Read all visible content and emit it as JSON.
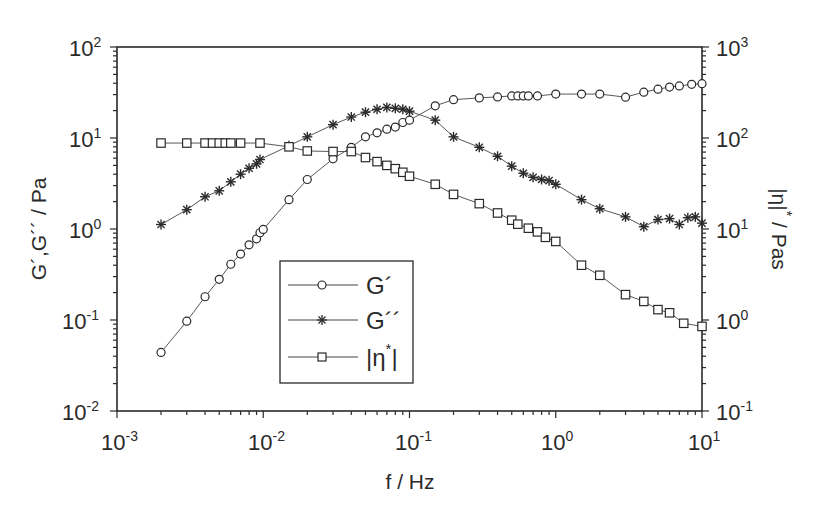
{
  "chart_data": {
    "type": "scatter",
    "title": "",
    "xlabel": "f / Hz",
    "ylabel": "G´,G´´ / Pa",
    "y2label": "|η*| / Pas",
    "xscale": "log",
    "yscale": "log",
    "xlim": [
      0.001,
      10
    ],
    "ylim": [
      0.01,
      100
    ],
    "y2lim": [
      0.1,
      1000
    ],
    "x_ticks": [
      "10^-3",
      "10^-2",
      "10^-1",
      "10^0",
      "10^1"
    ],
    "y_ticks": [
      "10^-2",
      "10^-1",
      "10^0",
      "10^1",
      "10^2"
    ],
    "y2_ticks": [
      "10^-1",
      "10^0",
      "10^1",
      "10^2",
      "10^3"
    ],
    "grid": false,
    "legend_position": "lower-left-center (inside plot)",
    "series": [
      {
        "name": "G´",
        "marker": "circle",
        "axis": "left",
        "x": [
          0.002,
          0.003,
          0.004,
          0.005,
          0.006,
          0.007,
          0.008,
          0.009,
          0.0095,
          0.01,
          0.015,
          0.02,
          0.03,
          0.04,
          0.05,
          0.06,
          0.07,
          0.08,
          0.09,
          0.1,
          0.15,
          0.2,
          0.3,
          0.4,
          0.5,
          0.55,
          0.6,
          0.65,
          0.75,
          1.0,
          1.5,
          2.0,
          3.0,
          4.0,
          5.0,
          6.0,
          7.0,
          8.5,
          10.0
        ],
        "values": [
          0.044,
          0.097,
          0.18,
          0.28,
          0.41,
          0.53,
          0.67,
          0.78,
          0.91,
          0.99,
          2.1,
          3.5,
          5.9,
          7.9,
          10.3,
          11.4,
          12.5,
          13.2,
          14.8,
          15.7,
          22.6,
          26.4,
          27.6,
          28.3,
          29.0,
          29.0,
          29.0,
          29.0,
          29.0,
          30.4,
          30.4,
          30.4,
          28.1,
          31.9,
          34.4,
          36.3,
          37.3,
          38.9,
          39.5
        ]
      },
      {
        "name": "G´´",
        "marker": "asterisk",
        "axis": "left",
        "x": [
          0.002,
          0.003,
          0.004,
          0.005,
          0.006,
          0.007,
          0.008,
          0.009,
          0.0095,
          0.015,
          0.02,
          0.03,
          0.04,
          0.05,
          0.06,
          0.07,
          0.08,
          0.09,
          0.1,
          0.15,
          0.2,
          0.3,
          0.4,
          0.5,
          0.6,
          0.7,
          0.8,
          0.9,
          1.0,
          1.5,
          2.0,
          3.0,
          4.0,
          5.0,
          6.0,
          7.0,
          8.0,
          9.0,
          10.0
        ],
        "values": [
          1.12,
          1.63,
          2.26,
          2.63,
          3.3,
          4.0,
          4.65,
          5.2,
          5.8,
          8.2,
          10.3,
          14.0,
          17.0,
          19.2,
          20.7,
          21.7,
          21.2,
          20.7,
          19.7,
          15.7,
          10.3,
          7.9,
          6.3,
          4.9,
          4.1,
          3.7,
          3.5,
          3.4,
          3.1,
          2.1,
          1.67,
          1.36,
          1.06,
          1.27,
          1.3,
          1.12,
          1.33,
          1.36,
          1.16
        ]
      },
      {
        "name": "|η*|",
        "marker": "square",
        "axis": "right",
        "x": [
          0.002,
          0.003,
          0.004,
          0.0045,
          0.005,
          0.0055,
          0.006,
          0.007,
          0.0095,
          0.015,
          0.02,
          0.03,
          0.04,
          0.05,
          0.06,
          0.07,
          0.08,
          0.09,
          0.1,
          0.15,
          0.2,
          0.3,
          0.4,
          0.5,
          0.55,
          0.65,
          0.75,
          0.85,
          1.0,
          1.5,
          2.0,
          3.0,
          4.0,
          5.0,
          6.0,
          7.5,
          10.0
        ],
        "values": [
          88,
          88,
          88,
          88,
          88,
          88,
          88,
          88,
          88,
          80,
          72,
          71,
          71,
          61,
          55,
          50,
          46,
          42,
          38,
          31,
          24,
          19,
          15,
          12.5,
          11.3,
          10.2,
          9.3,
          8.1,
          7.3,
          4.0,
          3.1,
          1.9,
          1.6,
          1.3,
          1.2,
          0.92,
          0.85
        ]
      }
    ]
  },
  "axes": {
    "x": {
      "title": "f / Hz",
      "ticks": [
        {
          "base": "10",
          "exp": "-3"
        },
        {
          "base": "10",
          "exp": "-2"
        },
        {
          "base": "10",
          "exp": "-1"
        },
        {
          "base": "10",
          "exp": "0"
        },
        {
          "base": "10",
          "exp": "1"
        }
      ]
    },
    "y_left": {
      "title": "G´,G´´ / Pa",
      "ticks": [
        {
          "base": "10",
          "exp": "2"
        },
        {
          "base": "10",
          "exp": "1"
        },
        {
          "base": "10",
          "exp": "0"
        },
        {
          "base": "10",
          "exp": "-1"
        },
        {
          "base": "10",
          "exp": "-2"
        }
      ]
    },
    "y_right": {
      "title_main": "|η|",
      "title_star": "*",
      "title_unit": " / Pas",
      "ticks": [
        {
          "base": "10",
          "exp": "3"
        },
        {
          "base": "10",
          "exp": "2"
        },
        {
          "base": "10",
          "exp": "1"
        },
        {
          "base": "10",
          "exp": "0"
        },
        {
          "base": "10",
          "exp": "-1"
        }
      ]
    }
  },
  "legend": {
    "items": [
      {
        "label": "G´",
        "marker": "circle"
      },
      {
        "label": "G´´",
        "marker": "asterisk"
      },
      {
        "label": "|η*|",
        "marker": "square"
      }
    ],
    "eta_main": "|η",
    "eta_star": "*",
    "eta_close": "|"
  },
  "colors": {
    "ink": "#2a2a2a",
    "line": "#444444",
    "background": "#ffffff"
  }
}
